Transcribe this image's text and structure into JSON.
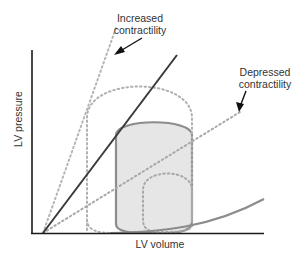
{
  "diagram": {
    "axes": {
      "x_label": "LV volume",
      "y_label": "LV pressure"
    },
    "annotations": {
      "increased": [
        "Increased",
        "contractility"
      ],
      "depressed": [
        "Depressed",
        "contractility"
      ]
    },
    "elements": [
      {
        "name": "ESPVR baseline",
        "style": "solid dark line"
      },
      {
        "name": "ESPVR increased contractility",
        "style": "dotted gray line"
      },
      {
        "name": "ESPVR depressed contractility",
        "style": "dotted gray line"
      },
      {
        "name": "EDPVR",
        "style": "solid gray curve"
      },
      {
        "name": "baseline PV loop",
        "style": "solid gray outline, light gray fill"
      },
      {
        "name": "increased contractility PV loop",
        "style": "dotted gray outline"
      },
      {
        "name": "depressed contractility PV loop",
        "style": "dotted gray outline"
      }
    ],
    "colors": {
      "axis": "#1a1a1a",
      "espvr": "#3a3a3a",
      "loop_stroke": "#8c8c8c",
      "loop_fill": "#e6e6e6",
      "dotted": "#b0b0b0",
      "text": "#333333"
    }
  }
}
